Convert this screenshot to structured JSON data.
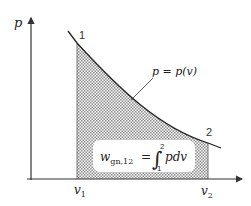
{
  "diagram": {
    "type": "p-v work diagram",
    "y_axis_label": "p",
    "x_axis_labels": {
      "v1": {
        "base": "v",
        "sub": "1"
      },
      "v2": {
        "base": "v",
        "sub": "2"
      }
    },
    "state_points": [
      {
        "id": "1",
        "label": "1"
      },
      {
        "id": "2",
        "label": "2"
      }
    ],
    "curve_label": "p = p(v)",
    "formula": {
      "lhs_base": "w",
      "lhs_sub": "gn,12",
      "equals": "=",
      "integral_symbol": "∫",
      "upper_limit": "2",
      "lower_limit": "1",
      "integrand": "pdv"
    },
    "colors": {
      "axis": "#333333",
      "curve": "#222222",
      "hatch": "#8a8a8a",
      "box_fill": "#ffffff"
    }
  }
}
